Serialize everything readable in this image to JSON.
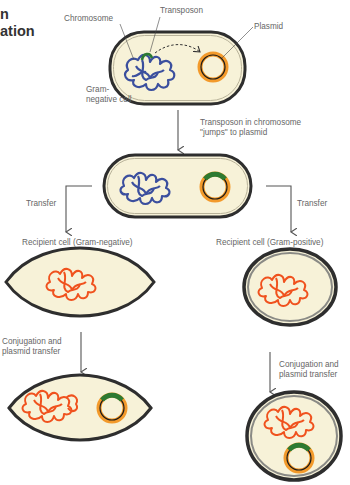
{
  "title": {
    "line1": "n",
    "line2": "ation"
  },
  "colors": {
    "cell_fill": "#f7f2d8",
    "cell_wall": "#2e2e2e",
    "cell_wall_gray": "#8a8a85",
    "chromosome_donor": "#3b4f9e",
    "chromosome_recipient": "#f0521e",
    "transposon": "#2d7a32",
    "plasmid_outer": "#f39a2b",
    "plasmid_inner": "#1a1a1a",
    "arrow": "#555555",
    "label_text": "#666666"
  },
  "labels": {
    "chromosome": "Chromosome",
    "transposon": "Transposon",
    "plasmid": "Plasmid",
    "gram_negative_cell_line1": "Gram-",
    "gram_negative_cell_line2": "negative cell",
    "jump_line1": "Transposon in chromosome",
    "jump_line2": "\"jumps\" to plasmid",
    "transfer_left": "Transfer",
    "transfer_right": "Transfer",
    "recipient_gram_negative": "Recipient cell (Gram-negative)",
    "recipient_gram_positive": "Recipient cell (Gram-positive)",
    "conjugation_left_line1": "Conjugation and",
    "conjugation_left_line2": "plasmid transfer",
    "conjugation_right_line1": "Conjugation and",
    "conjugation_right_line2": "plasmid transfer"
  },
  "stages": [
    {
      "id": "donor-initial",
      "cell_type": "Gram-negative",
      "contents": [
        "chromosome with transposon",
        "plasmid"
      ]
    },
    {
      "id": "donor-after-jump",
      "cell_type": "Gram-negative",
      "contents": [
        "chromosome",
        "plasmid with transposon"
      ]
    },
    {
      "id": "recipient-gram-negative",
      "cell_type": "Gram-negative",
      "contents": [
        "chromosome"
      ]
    },
    {
      "id": "recipient-gram-positive",
      "cell_type": "Gram-positive",
      "contents": [
        "chromosome"
      ]
    },
    {
      "id": "result-gram-negative",
      "cell_type": "Gram-negative",
      "contents": [
        "chromosome",
        "plasmid with transposon"
      ]
    },
    {
      "id": "result-gram-positive",
      "cell_type": "Gram-positive",
      "contents": [
        "chromosome",
        "plasmid with transposon"
      ]
    }
  ]
}
